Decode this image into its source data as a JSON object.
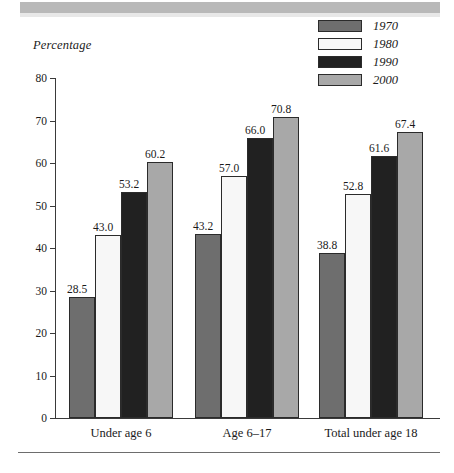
{
  "figure": {
    "axis_title": "Percentage",
    "top_band_present": true,
    "bottom_rule_present": true
  },
  "legend": {
    "position": "top-right",
    "entries": [
      {
        "label": "1970",
        "color": "#6e6e6e"
      },
      {
        "label": "1980",
        "color": "#f7f7f7"
      },
      {
        "label": "1990",
        "color": "#212121"
      },
      {
        "label": "2000",
        "color": "#a8a8a8"
      }
    ]
  },
  "axis": {
    "y_ticks": [
      "0",
      "10",
      "20",
      "30",
      "40",
      "50",
      "60",
      "70",
      "80"
    ],
    "x_categories": [
      "Under age 6",
      "Age 6–17",
      "Total under age 18"
    ]
  },
  "chart_data": {
    "type": "bar",
    "title": "",
    "subtitle": "",
    "xlabel": "",
    "ylabel": "Percentage",
    "ylim": [
      0,
      80
    ],
    "ytick_step": 10,
    "grid": false,
    "legend_position": "top-right",
    "categories": [
      "Under age 6",
      "Age 6–17",
      "Total under age 18"
    ],
    "series": [
      {
        "name": "1970",
        "color": "#6e6e6e",
        "values": [
          28.5,
          43.2,
          38.8
        ],
        "labels": [
          "28.5",
          "43.2",
          "38.8"
        ]
      },
      {
        "name": "1980",
        "color": "#f7f7f7",
        "values": [
          43.0,
          57.0,
          52.8
        ],
        "labels": [
          "43.0",
          "57.0",
          "52.8"
        ]
      },
      {
        "name": "1990",
        "color": "#212121",
        "values": [
          53.2,
          66.0,
          61.6
        ],
        "labels": [
          "53.2",
          "66.0",
          "61.6"
        ]
      },
      {
        "name": "2000",
        "color": "#a8a8a8",
        "values": [
          60.2,
          70.8,
          67.4
        ],
        "labels": [
          "60.2",
          "70.8",
          "67.4"
        ]
      }
    ]
  }
}
